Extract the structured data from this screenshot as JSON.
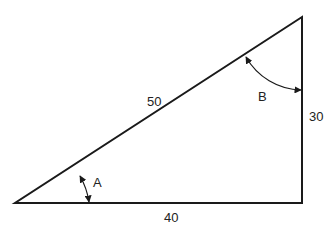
{
  "diagram": {
    "type": "right-triangle",
    "sides": {
      "hypotenuse": "50",
      "vertical": "30",
      "base": "40"
    },
    "angles": {
      "bottom_left": "A",
      "top_right": "B"
    },
    "colors": {
      "stroke": "#1a1a1a",
      "background": "#ffffff",
      "text": "#222222"
    }
  }
}
